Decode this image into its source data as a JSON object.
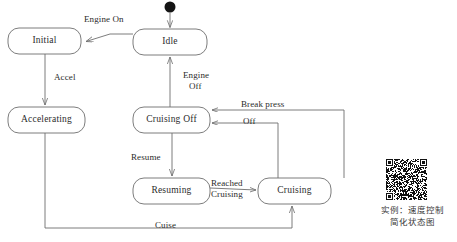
{
  "diagram": {
    "type": "uml-state-machine",
    "stroke_color": "#6e6e6e",
    "text_color": "#2b2b2b",
    "start_node": {
      "name": "start-node",
      "shape": "filled-circle"
    },
    "states": [
      {
        "id": "initial",
        "label": "Initial",
        "x": 8,
        "y": 28,
        "w": 73,
        "h": 26
      },
      {
        "id": "idle",
        "label": "Idle",
        "x": 133,
        "y": 29,
        "w": 74,
        "h": 26
      },
      {
        "id": "accelerating",
        "label": "Accelerating",
        "x": 8,
        "y": 107,
        "w": 77,
        "h": 26
      },
      {
        "id": "cruising_off",
        "label": "Cruising Off",
        "x": 133,
        "y": 107,
        "w": 77,
        "h": 26
      },
      {
        "id": "resuming",
        "label": "Resuming",
        "x": 133,
        "y": 178,
        "w": 77,
        "h": 26
      },
      {
        "id": "cruising",
        "label": "Cruising",
        "x": 258,
        "y": 178,
        "w": 73,
        "h": 26
      }
    ],
    "transitions": [
      {
        "id": "t-start-idle",
        "label": "",
        "from": "start-node",
        "to": "idle"
      },
      {
        "id": "t-idle-initial",
        "label": "Engine On",
        "from": "idle",
        "to": "initial"
      },
      {
        "id": "t-initial-accelerating",
        "label": "Accel",
        "from": "initial",
        "to": "accelerating"
      },
      {
        "id": "t-cruisingoff-idle",
        "label": "Engine\nOff",
        "from": "cruising_off",
        "to": "idle"
      },
      {
        "id": "t-cruisingoff-resuming",
        "label": "Resume",
        "from": "cruising_off",
        "to": "resuming"
      },
      {
        "id": "t-resuming-cruising",
        "label": "Reached\nCruising",
        "from": "resuming",
        "to": "cruising"
      },
      {
        "id": "t-cruising-cruisingoff-off",
        "label": "Off",
        "from": "cruising",
        "to": "cruising_off"
      },
      {
        "id": "t-cruising-cruisingoff-brk",
        "label": "Break press",
        "from": "cruising",
        "to": "cruising_off"
      },
      {
        "id": "t-accelerating-cruising",
        "label": "Cuise",
        "from": "accelerating",
        "to": "cruising"
      }
    ],
    "edge_labels": [
      {
        "id": "lbl-engine-on",
        "text": "Engine On",
        "x": 84,
        "y": 20
      },
      {
        "id": "lbl-accel",
        "text": "Accel",
        "x": 54,
        "y": 72
      },
      {
        "id": "lbl-engine-off-1",
        "text": "Engine",
        "x": 183,
        "y": 71
      },
      {
        "id": "lbl-engine-off-2",
        "text": "Off",
        "x": 190,
        "y": 83
      },
      {
        "id": "lbl-resume",
        "text": "Resume",
        "x": 131,
        "y": 152
      },
      {
        "id": "lbl-break-press",
        "text": "Break press",
        "x": 241,
        "y": 100
      },
      {
        "id": "lbl-off",
        "text": "Off",
        "x": 243,
        "y": 126
      },
      {
        "id": "lbl-reached",
        "text": "Reached",
        "x": 212,
        "y": 180
      },
      {
        "id": "lbl-cruising-2",
        "text": "Cruising",
        "x": 212,
        "y": 191
      },
      {
        "id": "lbl-cuise",
        "text": "Cuise",
        "x": 155,
        "y": 221
      }
    ]
  },
  "caption": {
    "name": "figure-caption",
    "line1": "实例：速度控制",
    "line2": "简化状态图"
  },
  "qr_code": {
    "name": "qr-code",
    "alt": "qr-code-image"
  }
}
